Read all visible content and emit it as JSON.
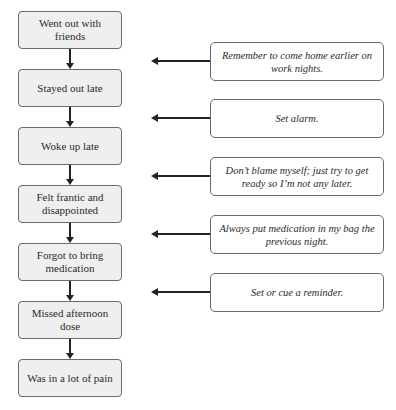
{
  "diagram": {
    "type": "flowchart",
    "events": [
      {
        "label": "Went out with friends"
      },
      {
        "label": "Stayed out late"
      },
      {
        "label": "Woke up late"
      },
      {
        "label": "Felt frantic and disappointed"
      },
      {
        "label": "Forgot to bring medication"
      },
      {
        "label": "Missed afternoon dose"
      },
      {
        "label": "Was in a lot of pain"
      }
    ],
    "coping_strategies": [
      {
        "label": "Remember to come home earlier on work nights.",
        "points_to": "between Went out with friends and Stayed out late"
      },
      {
        "label": "Set alarm.",
        "points_to": "between Stayed out late and Woke up late"
      },
      {
        "label": "Don’t blame myself; just try to get ready so I’m not any later.",
        "points_to": "between Woke up late and Felt frantic and disappointed"
      },
      {
        "label": "Always put medication in my bag the previous night.",
        "points_to": "between Felt frantic and disappointed and Forgot to bring medication"
      },
      {
        "label": "Set or cue a reminder.",
        "points_to": "between Forgot to bring medication and Missed afternoon dose"
      }
    ],
    "colors": {
      "event_fill": "#efefef",
      "coping_fill": "#ffffff",
      "border": "#6a6a6a",
      "arrow": "#222222"
    }
  }
}
